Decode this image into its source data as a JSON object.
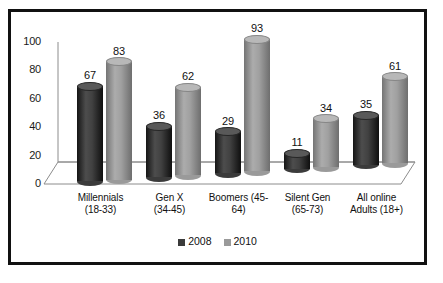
{
  "chart_data": {
    "type": "bar",
    "title": "",
    "subtitle": "",
    "xlabel": "",
    "ylabel": "",
    "ylim": [
      0,
      100
    ],
    "yticks": [
      "0",
      "20",
      "40",
      "60",
      "80",
      "100"
    ],
    "grid": false,
    "legend_position": "bottom",
    "style": "3d-cylinder",
    "categories": [
      "Millennials (18-33)",
      "Gen X (34-45)",
      "Boomers (45-64)",
      "Silent Gen (65-73)",
      "All online Adults (18+)"
    ],
    "category_lines": [
      [
        "Millennials",
        "(18-33)"
      ],
      [
        "Gen X",
        "(34-45)"
      ],
      [
        "Boomers (45-",
        "64)"
      ],
      [
        "Silent Gen",
        "(65-73)"
      ],
      [
        "All online",
        "Adults (18+)"
      ]
    ],
    "series": [
      {
        "name": "2008",
        "color": "#3b3b3b",
        "values": [
          67,
          36,
          29,
          11,
          35
        ]
      },
      {
        "name": "2010",
        "color": "#9a9a9a",
        "values": [
          83,
          62,
          93,
          34,
          61
        ]
      }
    ]
  },
  "legend": {
    "items": [
      {
        "label": "2008",
        "color": "#3b3b3b"
      },
      {
        "label": "2010",
        "color": "#9a9a9a"
      }
    ]
  },
  "colors": {
    "frame": "#111111",
    "axis": "#8c8c8c",
    "background": "#ffffff",
    "series_2008": "#3b3b3b",
    "series_2010": "#9a9a9a"
  }
}
